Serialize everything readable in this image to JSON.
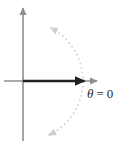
{
  "figure": {
    "name": "polar-axis-diagram",
    "background_color": "#ffffff",
    "width": 127,
    "height": 148
  },
  "labels": {
    "theta_zero": "θ = 0",
    "theta_symbol": "θ",
    "equals_sign": "=",
    "zero_value": "0"
  },
  "colors": {
    "axis": "#8e8e8e",
    "ray": "#231f20",
    "dotted_curve": "#d6d6d6",
    "label_text": "#231f20",
    "background": "#ffffff"
  },
  "chart_data": {
    "type": "line",
    "title": "",
    "subtitle": "",
    "xlabel": "",
    "ylabel": "",
    "grid": false,
    "legend_position": "none",
    "origin": {
      "x": 23,
      "y": 81
    },
    "xlim": [
      -19,
      104
    ],
    "ylim": [
      -67,
      81
    ],
    "axes": [
      {
        "name": "vertical-axis",
        "orientation": "vertical",
        "color": "#8e8e8e",
        "from": {
          "x": 23,
          "y": 141
        },
        "to": {
          "x": 23,
          "y": 8
        },
        "arrowhead": "end",
        "width": 1.6
      },
      {
        "name": "horizontal-axis",
        "orientation": "horizontal",
        "color": "#8e8e8e",
        "from": {
          "x": 4,
          "y": 81
        },
        "to": {
          "x": 97,
          "y": 81
        },
        "arrowhead": "end",
        "width": 1.6
      }
    ],
    "series": [
      {
        "name": "polar-axis-ray",
        "style": "solid",
        "color": "#231f20",
        "width": 2.4,
        "arrowhead": "end",
        "label": "θ = 0",
        "points": [
          {
            "x": 23,
            "y": 81
          },
          {
            "x": 86,
            "y": 81
          }
        ]
      },
      {
        "name": "dotted-circle-arc",
        "style": "dotted",
        "color": "#d6d6d6",
        "width": 2.0,
        "arrowhead": "both",
        "label": "",
        "shape": "circular-arc",
        "center": {
          "x": 23,
          "y": 81
        },
        "radius": 60,
        "start_angle_deg": 62,
        "end_angle_deg": -64
      }
    ],
    "annotations": [
      {
        "name": "theta-equals-zero-label",
        "text": "θ = 0",
        "x": 87,
        "y": 98,
        "color": "#231f20",
        "font_style": "italic-serif"
      }
    ]
  }
}
